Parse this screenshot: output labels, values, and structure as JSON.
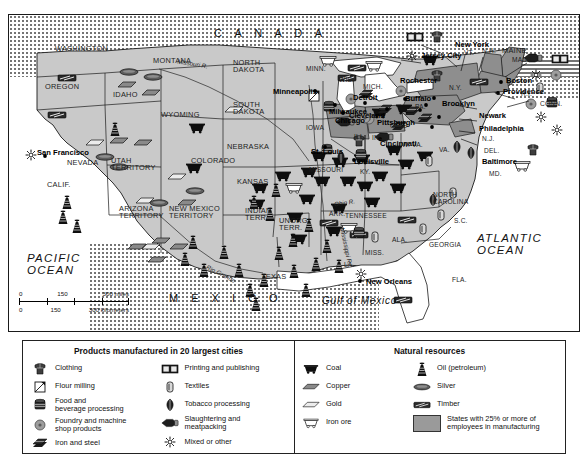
{
  "map": {
    "countries": [
      "C A N A D A",
      "M E X I C O"
    ],
    "oceans": [
      "PACIFIC OCEAN",
      "ATLANTIC OCEAN"
    ],
    "gulf": "Gulf of Mexico",
    "rivers": [
      "Missouri R.",
      "Mississippi R.",
      "Ohio R.",
      "Rio Grande"
    ],
    "scale": {
      "miles": {
        "ticks": [
          "0",
          "150",
          "300"
        ],
        "unit": "300 miles"
      },
      "kilometers": {
        "ticks": [
          "0",
          "150",
          "300"
        ],
        "unit": "300 kilometers"
      }
    },
    "states": [
      "WASHINGTON",
      "OREGON",
      "IDAHO",
      "MONTANA",
      "WYOMING",
      "NEVADA",
      "UTAH TERRITORY",
      "CALIF.",
      "ARIZONA TERRITORY",
      "NEW MEXICO TERRITORY",
      "COLORADO",
      "NORTH DAKOTA",
      "SOUTH DAKOTA",
      "NEBRASKA",
      "KANSAS",
      "INDIAN TERR.",
      "UNORG. TERR.",
      "TEXAS",
      "MINN.",
      "IOWA",
      "MISSOURI",
      "ARK.",
      "LA.",
      "WIS.",
      "ILL.",
      "MISS.",
      "ALA.",
      "TENNESSEE",
      "KY.",
      "IND.",
      "OHIO",
      "MICH.",
      "N.Y.",
      "PA.",
      "W. VA.",
      "VA.",
      "NORTH CAROLINA",
      "S.C.",
      "GEORGIA",
      "FLA.",
      "MD.",
      "DEL.",
      "N.J.",
      "CONN.",
      "R.I.",
      "MASS.",
      "VT.",
      "N.H.",
      "MAINE"
    ],
    "cities": [
      "New York",
      "Jersey City",
      "Rochester",
      "Buffalo",
      "Boston",
      "Providence",
      "Brooklyn",
      "Newark",
      "Philadelphia",
      "Baltimore",
      "Pittsburgh",
      "Cleveland",
      "Detroit",
      "Cincinnati",
      "Louisville",
      "Chicago",
      "Milwaukee",
      "Minneapolis",
      "St. Louis",
      "San Francisco",
      "New Orleans"
    ]
  },
  "legend": {
    "products": {
      "title": "Products manufactured in 20 largest cities",
      "col1": [
        {
          "icon": "clothing-icon",
          "label": "Clothing"
        },
        {
          "icon": "flour-milling-icon",
          "label": "Flour milling"
        },
        {
          "icon": "food-beverage-icon",
          "label": "Food and\nbeverage processing"
        },
        {
          "icon": "foundry-icon",
          "label": "Foundry and machine\nshop products"
        },
        {
          "icon": "iron-steel-icon",
          "label": "Iron and steel"
        }
      ],
      "col2": [
        {
          "icon": "printing-icon",
          "label": "Printing and publishing"
        },
        {
          "icon": "textiles-icon",
          "label": "Textiles"
        },
        {
          "icon": "tobacco-icon",
          "label": "Tobacco processing"
        },
        {
          "icon": "meatpacking-icon",
          "label": "Slaughtering and\nmeatpacking"
        },
        {
          "icon": "mixed-other-icon",
          "label": "Mixed or other"
        }
      ]
    },
    "resources": {
      "title": "Natural resources",
      "col1": [
        {
          "icon": "coal-icon",
          "label": "Coal"
        },
        {
          "icon": "copper-icon",
          "label": "Copper"
        },
        {
          "icon": "gold-icon",
          "label": "Gold"
        },
        {
          "icon": "iron-ore-icon",
          "label": "Iron ore"
        }
      ],
      "col2": [
        {
          "icon": "oil-derrick-icon",
          "label": "Oil (petroleum)"
        },
        {
          "icon": "silver-icon",
          "label": "Silver"
        },
        {
          "icon": "timber-icon",
          "label": "Timber"
        },
        {
          "icon": "manufacturing-swatch",
          "label": "States with 25% or more of\nemployees in manufacturing"
        }
      ]
    }
  },
  "colors": {
    "land": "#c9c9c9",
    "manufacturing_state": "#8e8e8e",
    "water": "#ffffff",
    "outline": "#1a1a1a",
    "stipple": "#6a6a6a"
  }
}
